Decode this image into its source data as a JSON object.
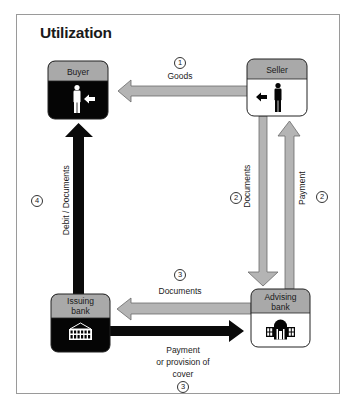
{
  "title": "Utilization",
  "colors": {
    "grey_arrow": "#b4b4b4",
    "grey_arrow_stroke": "#6a6a6a",
    "black_arrow": "#0a0a0a",
    "box_header": "#a9a9a9",
    "box_dark_body": "#050505",
    "box_light_body": "#ffffff",
    "frame": "#9a9a9a"
  },
  "nodes": {
    "buyer": {
      "label": "Buyer",
      "style": "dark",
      "icon": "person-icon"
    },
    "seller": {
      "label": "Seller",
      "style": "light",
      "icon": "person-icon"
    },
    "issuing_bank": {
      "label_line1": "Issuing",
      "label_line2": "bank",
      "style": "dark",
      "icon": "bank-building-icon"
    },
    "advising_bank": {
      "label_line1": "Advising",
      "label_line2": "bank",
      "style": "light",
      "icon": "bank-building-icon"
    }
  },
  "flows": [
    {
      "step": "1",
      "label": "Goods",
      "from": "Seller",
      "to": "Buyer",
      "style": "grey"
    },
    {
      "step": "2",
      "label": "Documents",
      "from": "Seller",
      "to": "Advising bank",
      "style": "grey"
    },
    {
      "step": "2",
      "label": "Payment",
      "from": "Advising bank",
      "to": "Seller",
      "style": "grey"
    },
    {
      "step": "3",
      "label": "Documents",
      "from": "Advising bank",
      "to": "Issuing bank",
      "style": "grey"
    },
    {
      "step": "3",
      "label_line1": "Payment",
      "label_line2": "or provision of",
      "label_line3": "cover",
      "from": "Issuing bank",
      "to": "Advising bank",
      "style": "black"
    },
    {
      "step": "4",
      "label": "Debit / Documents",
      "from": "Issuing bank",
      "to": "Buyer",
      "style": "black"
    }
  ]
}
